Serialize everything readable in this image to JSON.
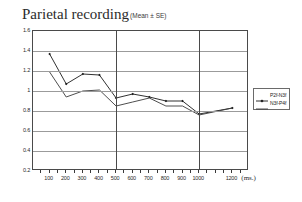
{
  "chart_data": {
    "type": "line",
    "title": "Parietal recording",
    "subtitle": "(Mean ± SE)",
    "xlabel": "(ms.)",
    "ylabel": "",
    "xlim": [
      0,
      1300
    ],
    "ylim": [
      0.2,
      1.6
    ],
    "grid": true,
    "legend_position": "right",
    "x": [
      100,
      200,
      300,
      400,
      500,
      600,
      700,
      800,
      900,
      1000,
      1200
    ],
    "xtick_labels": [
      "100",
      "200",
      "300",
      "400",
      "500",
      "600",
      "700",
      "800",
      "900",
      "1000",
      "1200"
    ],
    "ytick_labels": [
      "1.6",
      "1.4",
      "1.2",
      "1",
      "0.8",
      "0.6",
      "0.4",
      "0.2"
    ],
    "ytick_values": [
      1.6,
      1.4,
      1.2,
      1.0,
      0.8,
      0.6,
      0.4,
      0.2
    ],
    "vertical_gridlines_at": [
      500,
      1000
    ],
    "series": [
      {
        "name": "P2f-N3f",
        "marker": "diamond",
        "color": "#1a1a1a",
        "values": [
          1.37,
          1.07,
          1.17,
          1.16,
          0.93,
          0.97,
          0.94,
          0.9,
          0.9,
          0.77,
          0.83
        ]
      },
      {
        "name": "N3f-P4f",
        "marker": "none",
        "color": "#3a3a3a",
        "values": [
          1.19,
          0.94,
          1.0,
          1.01,
          0.85,
          0.89,
          0.93,
          0.85,
          0.85,
          0.76,
          0.83
        ]
      }
    ]
  },
  "legend": {
    "items": [
      {
        "label": "P2f-N3f"
      },
      {
        "label": "N3f-P4f"
      }
    ]
  },
  "axes": {
    "x_unit_label": "(ms.)"
  }
}
